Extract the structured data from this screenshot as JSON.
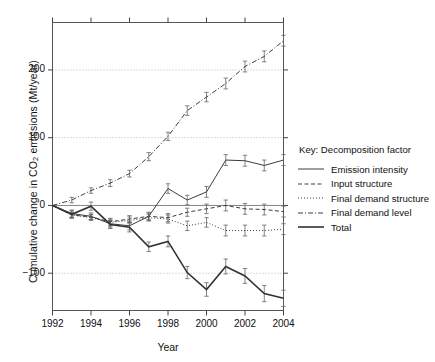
{
  "axes": {
    "ylabel_prefix": "Cumulative change in CO",
    "ylabel_sub": "2",
    "ylabel_suffix": " emissions (Mt/year)",
    "xlabel": "Year",
    "yticks": [
      "200",
      "100",
      "0",
      "−100"
    ],
    "xticks": [
      "1992",
      "1994",
      "1996",
      "1998",
      "2000",
      "2002",
      "2004"
    ]
  },
  "legend": {
    "title": "Key: Decomposition factor",
    "items": [
      {
        "label": "Emission intensity",
        "style": "solid",
        "icon": "line-solid-icon"
      },
      {
        "label": "Input structure",
        "style": "dashed",
        "icon": "line-dashed-icon"
      },
      {
        "label": "Final demand structure",
        "style": "dotted",
        "icon": "line-dotted-icon"
      },
      {
        "label": "Final demand level",
        "style": "dashdot",
        "icon": "line-dashdot-icon"
      },
      {
        "label": "Total",
        "style": "thick",
        "icon": "line-thick-icon"
      }
    ]
  },
  "chart_data": {
    "type": "line",
    "title": "",
    "xlabel": "Year",
    "ylabel": "Cumulative change in CO2 emissions (Mt/year)",
    "xlim": [
      1992,
      2004
    ],
    "ylim": [
      -155,
      270
    ],
    "ytick_values": [
      200,
      100,
      0,
      -100
    ],
    "xtick_values": [
      1992,
      1994,
      1996,
      1998,
      2000,
      2002,
      2004
    ],
    "grid": "horizontal-dotted",
    "legend_position": "right",
    "error_bars": true,
    "x": [
      1992,
      1993,
      1994,
      1995,
      1996,
      1997,
      1998,
      1999,
      2000,
      2001,
      2002,
      2003,
      2004
    ],
    "series": [
      {
        "name": "Emission intensity",
        "style": "solid",
        "values": [
          0,
          -12,
          -16,
          -27,
          -30,
          -16,
          25,
          8,
          20,
          67,
          66,
          59,
          67
        ],
        "errors": [
          0,
          5,
          5,
          5,
          6,
          6,
          7,
          7,
          8,
          8,
          8,
          8,
          8
        ]
      },
      {
        "name": "Input structure",
        "style": "dashed",
        "values": [
          0,
          -14,
          -17,
          -24,
          -20,
          -16,
          -18,
          -10,
          -5,
          0,
          -5,
          -6,
          -9
        ],
        "errors": [
          0,
          4,
          4,
          5,
          5,
          5,
          6,
          6,
          7,
          8,
          8,
          8,
          8
        ]
      },
      {
        "name": "Final demand structure",
        "style": "dotted",
        "values": [
          0,
          -14,
          -18,
          -25,
          -22,
          -18,
          -20,
          -30,
          -25,
          -37,
          -37,
          -37,
          -35
        ],
        "errors": [
          0,
          4,
          4,
          5,
          5,
          5,
          6,
          7,
          7,
          8,
          8,
          8,
          8
        ]
      },
      {
        "name": "Final demand level",
        "style": "dashdot",
        "values": [
          0,
          8,
          22,
          33,
          47,
          72,
          102,
          140,
          160,
          180,
          205,
          220,
          243
        ],
        "errors": [
          0,
          4,
          4,
          5,
          5,
          6,
          6,
          7,
          7,
          8,
          8,
          8,
          8
        ]
      },
      {
        "name": "Total",
        "style": "thick",
        "values": [
          0,
          -13,
          -1,
          -28,
          -32,
          -61,
          -53,
          -99,
          -124,
          -90,
          -104,
          -130,
          -137
        ],
        "errors": [
          0,
          6,
          6,
          6,
          7,
          7,
          8,
          9,
          10,
          11,
          11,
          12,
          12
        ]
      }
    ]
  }
}
